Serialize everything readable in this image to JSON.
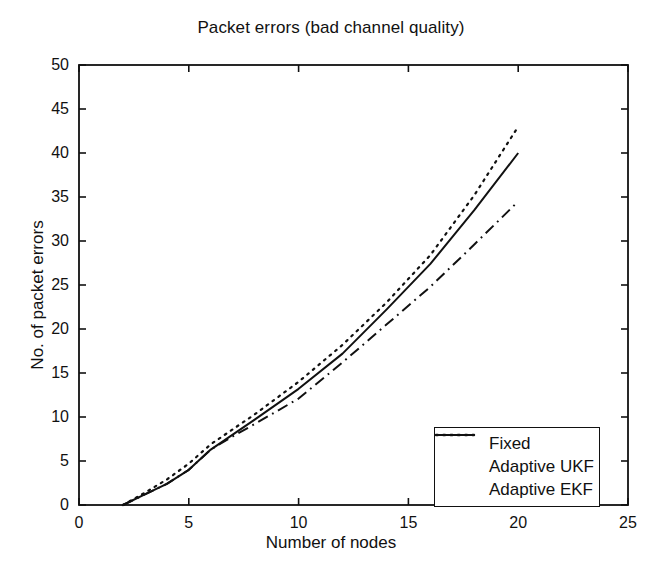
{
  "chart_data": {
    "type": "line",
    "title": "Packet errors (bad channel quality)",
    "xlabel": "Number of nodes",
    "ylabel": "No. of packet errors",
    "xlim": [
      0,
      25
    ],
    "ylim": [
      0,
      50
    ],
    "xticks": [
      0,
      5,
      10,
      15,
      20,
      25
    ],
    "yticks": [
      0,
      5,
      10,
      15,
      20,
      25,
      30,
      35,
      40,
      45,
      50
    ],
    "xtick_labels": [
      "0",
      "5",
      "10",
      "15",
      "20",
      "25"
    ],
    "ytick_labels": [
      "0",
      "5",
      "10",
      "15",
      "20",
      "25",
      "30",
      "35",
      "40",
      "45",
      "50"
    ],
    "grid": false,
    "legend_position": "lower right",
    "series": [
      {
        "name": "Fixed",
        "style": "dotted",
        "color": "#111111",
        "x": [
          2,
          3,
          4,
          5,
          6,
          7,
          8,
          10,
          12,
          14,
          16,
          18,
          20
        ],
        "y": [
          0,
          1.4,
          2.9,
          4.7,
          6.9,
          8.6,
          10.3,
          14.0,
          18.2,
          23.0,
          28.4,
          35.2,
          43.0
        ]
      },
      {
        "name": "Adaptive UKF",
        "style": "dash-dot",
        "color": "#111111",
        "x": [
          2,
          3,
          4,
          5,
          6,
          7,
          8,
          10,
          12,
          14,
          16,
          18,
          20
        ],
        "y": [
          0,
          1.2,
          2.4,
          4.0,
          6.3,
          7.8,
          9.2,
          12.1,
          16.2,
          20.5,
          24.8,
          29.6,
          34.5
        ]
      },
      {
        "name": "Adaptive EKF",
        "style": "solid",
        "color": "#111111",
        "x": [
          2,
          3,
          4,
          5,
          6,
          7,
          8,
          10,
          12,
          14,
          16,
          18,
          20
        ],
        "y": [
          0,
          1.2,
          2.4,
          4.0,
          6.3,
          8.0,
          9.7,
          13.2,
          17.2,
          22.2,
          27.4,
          33.5,
          40.0
        ]
      }
    ]
  },
  "legend": {
    "entries": [
      {
        "label": "Fixed",
        "style": "dotted"
      },
      {
        "label": "Adaptive UKF",
        "style": "dash-dot"
      },
      {
        "label": "Adaptive EKF",
        "style": "solid"
      }
    ]
  },
  "axes": {
    "frame_color": "#111111"
  }
}
